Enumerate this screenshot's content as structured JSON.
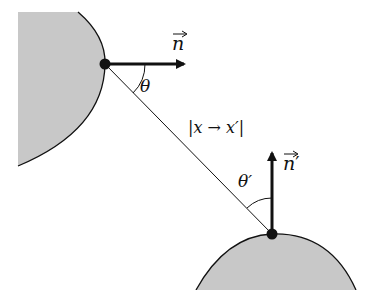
{
  "diagram": {
    "type": "geometry-radiance-transfer",
    "colors": {
      "surface_fill": "#c8c8c8",
      "stroke": "#111111",
      "background": "#ffffff"
    },
    "surfaces": [
      {
        "id": "surface-top-left",
        "point": [
          105,
          64
        ],
        "normal_direction": "right"
      },
      {
        "id": "surface-bottom-right",
        "point": [
          272,
          234
        ],
        "normal_direction": "up"
      }
    ],
    "labels": {
      "normal_1": "n",
      "normal_2": "n",
      "normal_2_prime": "′",
      "theta_1": "θ",
      "theta_2": "θ′",
      "distance": "|x → x′|"
    }
  }
}
